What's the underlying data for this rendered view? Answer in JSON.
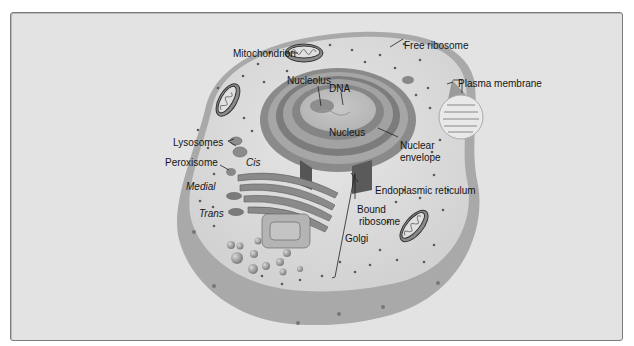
{
  "diagram": {
    "type": "animal cell cross-section",
    "colors": {
      "background": "#e3e3e3",
      "cytoplasm": "#dcdcdc",
      "cell_wall_rim": "#a8a8a8",
      "organelle_dark": "#6e6e6e",
      "organelle_mid": "#9a9a9a",
      "ribosome_dot": "#5a5a5a"
    },
    "labels": {
      "mitochondrion": "Mitochondrion",
      "free_ribosome": "Free ribosome",
      "nucleolus": "Nucleolus",
      "dna": "DNA",
      "plasma_membrane": "Plasma membrane",
      "nucleus": "Nucleus",
      "nuclear_envelope_1": "Nuclear",
      "nuclear_envelope_2": "envelope",
      "lysosomes": "Lysosomes",
      "peroxisome": "Peroxisome",
      "cis": "Cis",
      "medial": "Medial",
      "trans": "Trans",
      "endoplasmic_reticulum": "Endoplasmic reticulum",
      "bound_ribosome_1": "Bound",
      "bound_ribosome_2": "ribosome",
      "golgi": "Golgi"
    }
  }
}
